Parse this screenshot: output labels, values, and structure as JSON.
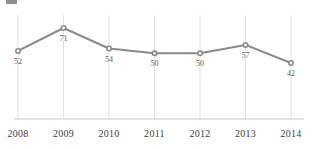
{
  "legend": {
    "swatch_color": "#8f8f8f",
    "label": ""
  },
  "colors": {
    "line": "#8a8a8a",
    "marker": "#8a8a8a",
    "gridline": "#e2e2e2",
    "axis": "#c9c9c9",
    "tick_text": "#3b3b3b",
    "value_text": "#5a5a5a"
  },
  "chart_data": {
    "type": "line",
    "title": "",
    "xlabel": "",
    "ylabel": "",
    "categories": [
      "2008",
      "2009",
      "2010",
      "2011",
      "2012",
      "2013",
      "2014"
    ],
    "values": [
      52,
      71,
      54,
      50,
      50,
      57,
      42
    ],
    "value_labels": [
      "52",
      "71",
      "54",
      "50",
      "50",
      "57",
      "42"
    ],
    "series": [
      {
        "name": "",
        "values": [
          52,
          71,
          54,
          50,
          50,
          57,
          42
        ]
      }
    ],
    "ylim": [
      0,
      80
    ],
    "grid": "vertical",
    "legend_position": "top-left",
    "markers": true,
    "data_labels": true
  },
  "axis": {
    "x_tick_labels": [
      "2008",
      "2009",
      "2010",
      "2011",
      "2012",
      "2013",
      "2014"
    ]
  }
}
